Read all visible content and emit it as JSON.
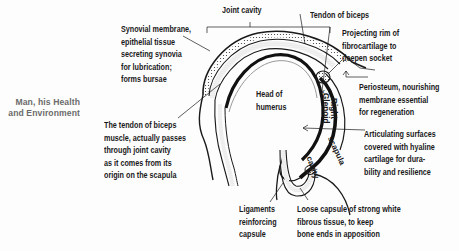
{
  "running_head": {
    "line1": "Man, his Health",
    "line2": "and Environment"
  },
  "diagram": {
    "center_label": {
      "line1": "Head of",
      "line2": "humerus"
    },
    "rotated_labels": {
      "right": "Right",
      "glenoid": "Glenoid",
      "cavity": "cavity",
      "scapula": "scapula"
    },
    "labels": {
      "joint_cavity": "Joint cavity",
      "tendon_of_biceps": "Tendon of biceps",
      "synovial": {
        "line1": "Synovial membrane,",
        "line2": "epithelial tissue",
        "line3": "secreting synovia",
        "line4": "for lubrication;",
        "line5": "forms bursae"
      },
      "projecting_rim": {
        "line1": "Projecting rim of",
        "line2": "fibrocartilage to",
        "line3": "deepen socket"
      },
      "periosteum": {
        "line1": "Periosteum, nourishing",
        "line2": "membrane essential",
        "line3": "for regeneration"
      },
      "tendon_passes": {
        "line1": "The tendon of biceps",
        "line2": "muscle, actually passes",
        "line3": "through joint cavity",
        "line4": "as it comes from its",
        "line5": "origin on the scapula"
      },
      "articulating": {
        "line1": "Articulating surfaces",
        "line2": "covered with hyaline",
        "line3": "cartilage for dura-",
        "line4": "bility and resilience"
      },
      "ligaments": {
        "line1": "Ligaments",
        "line2": "reinforcing",
        "line3": "capsule"
      },
      "loose_capsule": {
        "line1": "Loose capsule of strong white",
        "line2": "fibrous tissue, to keep",
        "line3": "bone ends in apposition"
      }
    },
    "colors": {
      "ink": "#1a1a1a",
      "running_head": "#6b6b6b",
      "background": "#fdfdfd"
    }
  }
}
